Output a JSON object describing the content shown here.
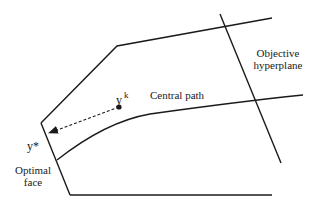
{
  "diagram": {
    "type": "interior-point-method-illustration",
    "labels": {
      "objective_hyperplane_line1": "Objective",
      "objective_hyperplane_line2": "hyperplane",
      "central_path": "Central path",
      "iterate_base": "y",
      "iterate_sup": "k",
      "optimal_point": "y*",
      "optimal_face_line1": "Optimal",
      "optimal_face_line2": "face"
    },
    "colors": {
      "stroke": "#1a1a1a",
      "background": "#ffffff"
    }
  }
}
